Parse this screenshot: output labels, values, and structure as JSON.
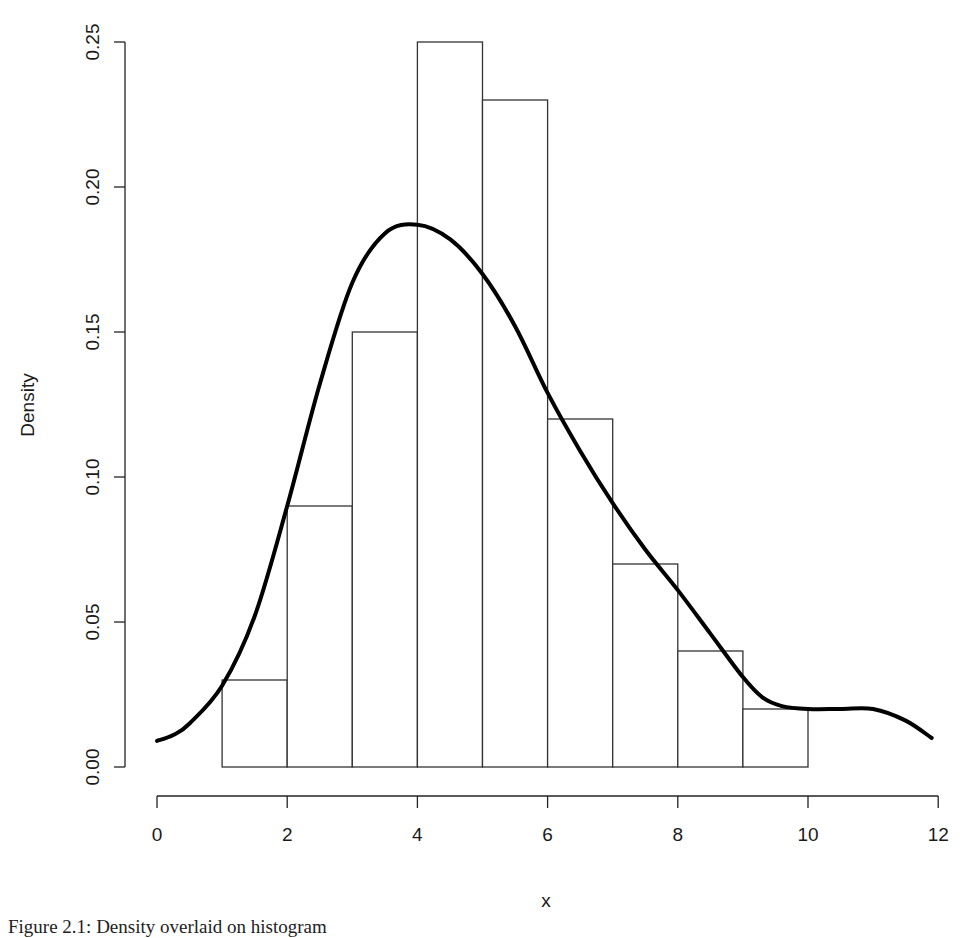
{
  "chart_data": {
    "type": "bar",
    "subtype": "histogram_with_density_curve",
    "title": "",
    "xlabel": "x",
    "ylabel": "Density",
    "xlim": [
      0,
      12
    ],
    "ylim": [
      0,
      0.25
    ],
    "x_ticks": [
      "0",
      "2",
      "4",
      "6",
      "8",
      "10",
      "12"
    ],
    "y_ticks": [
      "0.00",
      "0.05",
      "0.10",
      "0.15",
      "0.20",
      "0.25"
    ],
    "grid": false,
    "legend": null,
    "bins": [
      {
        "from": 1,
        "to": 2,
        "density": 0.03
      },
      {
        "from": 2,
        "to": 3,
        "density": 0.09
      },
      {
        "from": 3,
        "to": 4,
        "density": 0.15
      },
      {
        "from": 4,
        "to": 5,
        "density": 0.25
      },
      {
        "from": 5,
        "to": 6,
        "density": 0.23
      },
      {
        "from": 6,
        "to": 7,
        "density": 0.12
      },
      {
        "from": 7,
        "to": 8,
        "density": 0.07
      },
      {
        "from": 8,
        "to": 9,
        "density": 0.04
      },
      {
        "from": 9,
        "to": 10,
        "density": 0.02
      }
    ],
    "categories": [
      "1-2",
      "2-3",
      "3-4",
      "4-5",
      "5-6",
      "6-7",
      "7-8",
      "8-9",
      "9-10"
    ],
    "values": [
      0.03,
      0.09,
      0.15,
      0.25,
      0.23,
      0.12,
      0.07,
      0.04,
      0.02
    ],
    "series": [
      {
        "name": "density curve",
        "type": "line",
        "x": [
          0,
          0.25,
          0.5,
          1.0,
          1.5,
          2.0,
          2.5,
          3.0,
          3.5,
          4.0,
          4.5,
          5.0,
          5.5,
          6.0,
          6.5,
          7.0,
          7.5,
          8.0,
          8.5,
          9.0,
          9.3,
          9.6,
          10.0,
          10.5,
          11.0,
          11.5,
          11.9
        ],
        "y": [
          0.009,
          0.011,
          0.015,
          0.028,
          0.052,
          0.09,
          0.132,
          0.167,
          0.184,
          0.187,
          0.182,
          0.17,
          0.152,
          0.129,
          0.109,
          0.091,
          0.075,
          0.061,
          0.046,
          0.031,
          0.024,
          0.021,
          0.02,
          0.02,
          0.02,
          0.016,
          0.01
        ]
      }
    ]
  },
  "caption": "Figure 2.1: Density overlaid on histogram"
}
